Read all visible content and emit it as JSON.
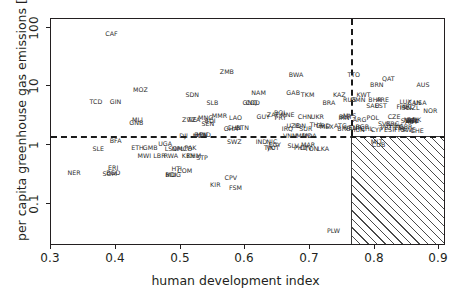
{
  "chart_data": {
    "type": "scatter",
    "title": "",
    "xlabel": "human development index",
    "ylabel": "per capita greenhouse gas emissions [tCO₂eq]",
    "xlim": [
      0.28,
      0.965
    ],
    "ylim": [
      0.07,
      160
    ],
    "yscale": "log",
    "xticks": [
      0.3,
      0.4,
      0.5,
      0.6,
      0.7,
      0.8,
      0.9
    ],
    "xticklabels": [
      "0.3",
      "0.4",
      "0.5",
      "0.6",
      "0.7",
      "0.8",
      "0.9"
    ],
    "yticks": [
      0.1,
      1,
      10,
      100
    ],
    "yticklabels": [
      "0.1",
      "1",
      "10",
      "100"
    ],
    "grid": false,
    "legend": "none",
    "annotations": {
      "hdi_threshold": 0.8,
      "emission_threshold": 3.0,
      "target_region": "hatched quadrant: HDI > 0.8 and emissions < 3 tCO2eq"
    },
    "point_label_type": "ISO3 country code",
    "points": [
      {
        "label": "CAF",
        "x": 0.385,
        "y": 95
      },
      {
        "label": "ZMB",
        "x": 0.585,
        "y": 26
      },
      {
        "label": "BWA",
        "x": 0.705,
        "y": 24
      },
      {
        "label": "TTO",
        "x": 0.805,
        "y": 24
      },
      {
        "label": "QAT",
        "x": 0.865,
        "y": 21
      },
      {
        "label": "MOZ",
        "x": 0.435,
        "y": 14
      },
      {
        "label": "BRN",
        "x": 0.845,
        "y": 17
      },
      {
        "label": "AUS",
        "x": 0.925,
        "y": 17
      },
      {
        "label": "SDN",
        "x": 0.525,
        "y": 12
      },
      {
        "label": "GAB",
        "x": 0.7,
        "y": 13
      },
      {
        "label": "NAM",
        "x": 0.64,
        "y": 13
      },
      {
        "label": "TKM",
        "x": 0.725,
        "y": 12
      },
      {
        "label": "KAZ",
        "x": 0.78,
        "y": 12
      },
      {
        "label": "KWT",
        "x": 0.822,
        "y": 12
      },
      {
        "label": "TCD",
        "x": 0.358,
        "y": 9.5
      },
      {
        "label": "GIN",
        "x": 0.392,
        "y": 9.5
      },
      {
        "label": "SLB",
        "x": 0.56,
        "y": 9.0
      },
      {
        "label": "GNQ",
        "x": 0.625,
        "y": 9.2
      },
      {
        "label": "COD",
        "x": 0.63,
        "y": 9.2
      },
      {
        "label": "BRA",
        "x": 0.762,
        "y": 9.0
      },
      {
        "label": "RUS",
        "x": 0.798,
        "y": 10
      },
      {
        "label": "OMN",
        "x": 0.812,
        "y": 10
      },
      {
        "label": "BHR",
        "x": 0.842,
        "y": 10
      },
      {
        "label": "ARE",
        "x": 0.855,
        "y": 10
      },
      {
        "label": "LUX",
        "x": 0.895,
        "y": 9.5
      },
      {
        "label": "CAN",
        "x": 0.91,
        "y": 9.0
      },
      {
        "label": "USA",
        "x": 0.92,
        "y": 9.0
      },
      {
        "label": "SAU",
        "x": 0.838,
        "y": 8.2
      },
      {
        "label": "EST",
        "x": 0.852,
        "y": 8.2
      },
      {
        "label": "FIN",
        "x": 0.888,
        "y": 8.0
      },
      {
        "label": "ISL",
        "x": 0.893,
        "y": 7.8
      },
      {
        "label": "IRL",
        "x": 0.9,
        "y": 8.0
      },
      {
        "label": "NZL",
        "x": 0.908,
        "y": 7.8
      },
      {
        "label": "NOR",
        "x": 0.938,
        "y": 7.0
      },
      {
        "label": "MLI",
        "x": 0.43,
        "y": 5.2
      },
      {
        "label": "GNB",
        "x": 0.428,
        "y": 4.6
      },
      {
        "label": "LAO",
        "x": 0.6,
        "y": 5.5
      },
      {
        "label": "MMR",
        "x": 0.572,
        "y": 5.8
      },
      {
        "label": "MNG",
        "x": 0.548,
        "y": 5.4
      },
      {
        "label": "ZWE",
        "x": 0.52,
        "y": 5.2
      },
      {
        "label": "TZA",
        "x": 0.528,
        "y": 5.2
      },
      {
        "label": "BDI",
        "x": 0.556,
        "y": 5.0
      },
      {
        "label": "SEN",
        "x": 0.552,
        "y": 4.5
      },
      {
        "label": "ZAF",
        "x": 0.665,
        "y": 6.0
      },
      {
        "label": "BOL",
        "x": 0.678,
        "y": 6.6
      },
      {
        "label": "MNE",
        "x": 0.69,
        "y": 6.0
      },
      {
        "label": "GUY",
        "x": 0.648,
        "y": 5.6
      },
      {
        "label": "PRY",
        "x": 0.678,
        "y": 5.4
      },
      {
        "label": "CHN",
        "x": 0.72,
        "y": 5.6
      },
      {
        "label": "UKR",
        "x": 0.742,
        "y": 5.6
      },
      {
        "label": "BLR",
        "x": 0.79,
        "y": 5.6
      },
      {
        "label": "MYS",
        "x": 0.798,
        "y": 5.8
      },
      {
        "label": "IRN",
        "x": 0.788,
        "y": 5.4
      },
      {
        "label": "ARG",
        "x": 0.815,
        "y": 5.2
      },
      {
        "label": "POL",
        "x": 0.838,
        "y": 5.5
      },
      {
        "label": "CZE",
        "x": 0.875,
        "y": 5.6
      },
      {
        "label": "NLD",
        "x": 0.903,
        "y": 5.2
      },
      {
        "label": "DEU",
        "x": 0.906,
        "y": 5.0
      },
      {
        "label": "BEL",
        "x": 0.908,
        "y": 5.0
      },
      {
        "label": "DNK",
        "x": 0.91,
        "y": 5.2
      },
      {
        "label": "SVN",
        "x": 0.898,
        "y": 5.0
      },
      {
        "label": "AUT",
        "x": 0.905,
        "y": 4.8
      },
      {
        "label": "UZB",
        "x": 0.7,
        "y": 4.2
      },
      {
        "label": "IRQ",
        "x": 0.69,
        "y": 3.8
      },
      {
        "label": "THA",
        "x": 0.74,
        "y": 4.3
      },
      {
        "label": "IDN",
        "x": 0.712,
        "y": 4.2
      },
      {
        "label": "GRD",
        "x": 0.752,
        "y": 4.2
      },
      {
        "label": "SUR",
        "x": 0.722,
        "y": 3.8
      },
      {
        "label": "MEX",
        "x": 0.758,
        "y": 4.0
      },
      {
        "label": "ATG",
        "x": 0.782,
        "y": 4.2
      },
      {
        "label": "BRB",
        "x": 0.788,
        "y": 3.8
      },
      {
        "label": "VEN",
        "x": 0.8,
        "y": 3.9
      },
      {
        "label": "TUR",
        "x": 0.808,
        "y": 3.9
      },
      {
        "label": "CHL",
        "x": 0.828,
        "y": 3.8
      },
      {
        "label": "HUN",
        "x": 0.812,
        "y": 3.6
      },
      {
        "label": "CYP",
        "x": 0.845,
        "y": 3.6
      },
      {
        "label": "ESP",
        "x": 0.868,
        "y": 3.6
      },
      {
        "label": "GRC",
        "x": 0.872,
        "y": 4.4
      },
      {
        "label": "HRV",
        "x": 0.878,
        "y": 4.2
      },
      {
        "label": "ITA",
        "x": 0.885,
        "y": 3.9
      },
      {
        "label": "GBR",
        "x": 0.895,
        "y": 4.0
      },
      {
        "label": "FRA",
        "x": 0.886,
        "y": 3.6
      },
      {
        "label": "SWE",
        "x": 0.9,
        "y": 3.6
      },
      {
        "label": "CHE",
        "x": 0.915,
        "y": 3.5
      },
      {
        "label": "PRT",
        "x": 0.862,
        "y": 3.9
      },
      {
        "label": "SVK",
        "x": 0.858,
        "y": 4.5
      },
      {
        "label": "BGR",
        "x": 0.82,
        "y": 4.0
      },
      {
        "label": "CHN2",
        "x": 0.598,
        "y": 3.9
      },
      {
        "label": "BTN",
        "x": 0.612,
        "y": 3.9
      },
      {
        "label": "GHA",
        "x": 0.592,
        "y": 3.8
      },
      {
        "label": "DJI",
        "x": 0.51,
        "y": 3.0
      },
      {
        "label": "BEN",
        "x": 0.54,
        "y": 3.1
      },
      {
        "label": "HND",
        "x": 0.545,
        "y": 3.1
      },
      {
        "label": "NGA",
        "x": 0.538,
        "y": 3.0
      },
      {
        "label": "VNM",
        "x": 0.695,
        "y": 3.0
      },
      {
        "label": "MDV",
        "x": 0.718,
        "y": 3.0
      },
      {
        "label": "MDA",
        "x": 0.728,
        "y": 3.0
      },
      {
        "label": "MLT",
        "x": 0.845,
        "y": 2.4
      },
      {
        "label": "CUB",
        "x": 0.848,
        "y": 2.2
      },
      {
        "label": "BFA",
        "x": 0.392,
        "y": 2.5
      },
      {
        "label": "SWZ",
        "x": 0.598,
        "y": 2.4
      },
      {
        "label": "IND",
        "x": 0.645,
        "y": 2.4
      },
      {
        "label": "NIC",
        "x": 0.663,
        "y": 2.4
      },
      {
        "label": "EGY",
        "x": 0.668,
        "y": 2.2
      },
      {
        "label": "TJK",
        "x": 0.658,
        "y": 2.0
      },
      {
        "label": "VUT",
        "x": 0.665,
        "y": 2.0
      },
      {
        "label": "SLV",
        "x": 0.7,
        "y": 2.1
      },
      {
        "label": "PHL",
        "x": 0.712,
        "y": 2.0
      },
      {
        "label": "CPV2",
        "x": 0.722,
        "y": 2.0
      },
      {
        "label": "MAR",
        "x": 0.726,
        "y": 2.2
      },
      {
        "label": "TON",
        "x": 0.732,
        "y": 1.9
      },
      {
        "label": "LKA",
        "x": 0.752,
        "y": 1.9
      },
      {
        "label": "SLE",
        "x": 0.362,
        "y": 1.9
      },
      {
        "label": "ETH",
        "x": 0.43,
        "y": 2.0
      },
      {
        "label": "GMB",
        "x": 0.452,
        "y": 2.0
      },
      {
        "label": "UGA",
        "x": 0.478,
        "y": 2.3
      },
      {
        "label": "LSO",
        "x": 0.488,
        "y": 1.9
      },
      {
        "label": "NPL",
        "x": 0.5,
        "y": 1.9
      },
      {
        "label": "MCO",
        "x": 0.512,
        "y": 1.9
      },
      {
        "label": "PAK",
        "x": 0.522,
        "y": 2.0
      },
      {
        "label": "KEN",
        "x": 0.518,
        "y": 1.5
      },
      {
        "label": "KHM",
        "x": 0.528,
        "y": 1.5
      },
      {
        "label": "STP",
        "x": 0.542,
        "y": 1.4
      },
      {
        "label": "MWI",
        "x": 0.442,
        "y": 1.5
      },
      {
        "label": "LBR",
        "x": 0.468,
        "y": 1.5
      },
      {
        "label": "RWA",
        "x": 0.488,
        "y": 1.5
      },
      {
        "label": "ERI",
        "x": 0.388,
        "y": 1.0
      },
      {
        "label": "NER",
        "x": 0.32,
        "y": 0.85
      },
      {
        "label": "SOM",
        "x": 0.382,
        "y": 0.82
      },
      {
        "label": "BGD",
        "x": 0.388,
        "y": 0.85
      },
      {
        "label": "HTI",
        "x": 0.498,
        "y": 0.95
      },
      {
        "label": "COM",
        "x": 0.512,
        "y": 0.9
      },
      {
        "label": "MDG",
        "x": 0.492,
        "y": 0.8
      },
      {
        "label": "BDI2",
        "x": 0.488,
        "y": 0.8
      },
      {
        "label": "CPV",
        "x": 0.592,
        "y": 0.72
      },
      {
        "label": "KIR",
        "x": 0.565,
        "y": 0.55
      },
      {
        "label": "FSM",
        "x": 0.6,
        "y": 0.5
      },
      {
        "label": "PLW",
        "x": 0.77,
        "y": 0.115
      }
    ]
  },
  "axes": {
    "xlabel": "human development index",
    "ylabel": "per capita greenhouse gas emissions [tCO₂eq]",
    "xtick_labels": [
      "0.3",
      "0.4",
      "0.5",
      "0.6",
      "0.7",
      "0.8",
      "0.9"
    ],
    "ytick_labels": [
      "0.1",
      "1",
      "10",
      "100"
    ]
  },
  "colors": {
    "axis": "#231f20",
    "label_text": "#2c2c2c",
    "dashed_line": "#1a1a1a",
    "hatch": "#4a4a4a",
    "background": "#ffffff"
  }
}
